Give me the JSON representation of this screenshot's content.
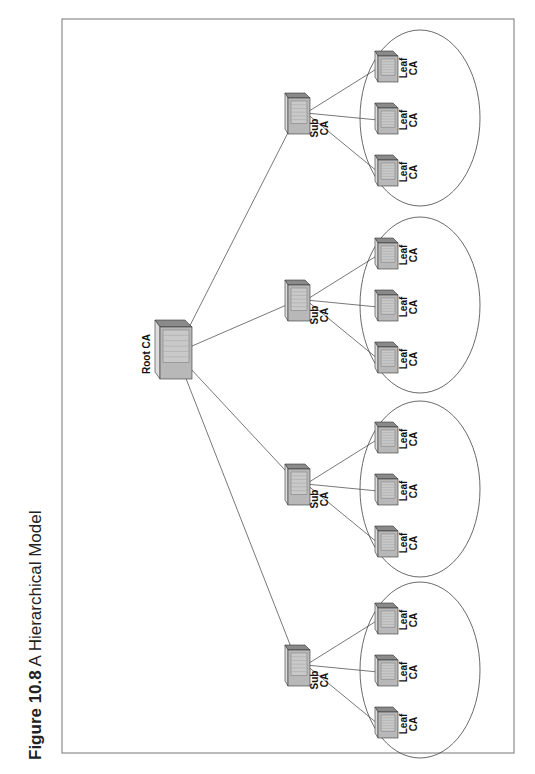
{
  "figure": {
    "number": "Figure 10.8",
    "title": "A Hierarchical Model"
  },
  "diagram": {
    "root": {
      "label": "Root CA"
    },
    "sub_cas": [
      {
        "label_line1": "Sub",
        "label_line2": "CA"
      },
      {
        "label_line1": "Sub",
        "label_line2": "CA"
      },
      {
        "label_line1": "Sub",
        "label_line2": "CA"
      },
      {
        "label_line1": "Sub",
        "label_line2": "CA"
      }
    ],
    "leaf_label_line1": "Leaf",
    "leaf_label_line2": "CA",
    "leaves_per_sub": 3
  },
  "colors": {
    "line": "#555555",
    "server_front": "#b8b8b8",
    "server_top": "#8a8a8a",
    "server_side": "#9c9c9c",
    "frame": "#666666"
  }
}
